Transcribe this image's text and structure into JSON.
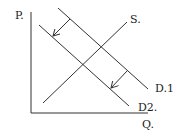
{
  "diagram": {
    "title": "",
    "axes": {
      "y_label": "P.",
      "x_label": "Q."
    },
    "curves": {
      "supply_label": "S.",
      "demand1_label": "D.1",
      "demand2_label": "D2."
    },
    "shift": {
      "direction": "demand shifts left from D1 to D2",
      "arrow_count": 2
    }
  }
}
